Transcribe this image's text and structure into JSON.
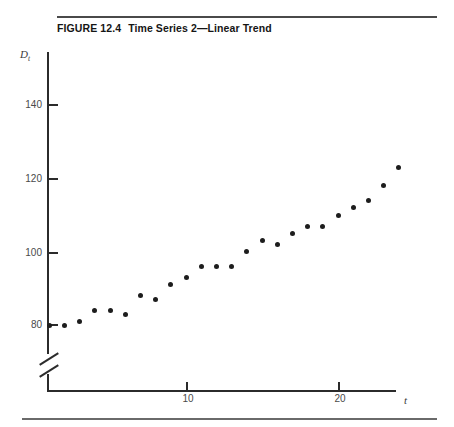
{
  "figure": {
    "number": "FIGURE 12.4",
    "title": "Time Series 2—Linear Trend"
  },
  "axes": {
    "y_title": "D",
    "y_subscript": "t",
    "x_title": "t",
    "y_ticks": [
      "80",
      "100",
      "120",
      "140"
    ],
    "x_ticks": [
      "10",
      "20"
    ],
    "y_axis_break": "double-slash-break"
  },
  "chart_data": {
    "type": "scatter",
    "title": "Time Series 2—Linear Trend",
    "xlabel": "t",
    "ylabel": "D_t",
    "xlim": [
      0,
      25
    ],
    "ylim": [
      76,
      148
    ],
    "xticks": [
      10,
      20
    ],
    "yticks": [
      80,
      100,
      120,
      140
    ],
    "grid": false,
    "legend": "none",
    "axis_break_y": true,
    "x": [
      1,
      2,
      3,
      4,
      5,
      6,
      7,
      8,
      9,
      10,
      11,
      12,
      13,
      14,
      15,
      16,
      17,
      18,
      19,
      20,
      21,
      22,
      23,
      24
    ],
    "y": [
      80,
      80,
      81,
      84,
      84,
      83,
      88,
      87,
      91,
      93,
      96,
      96,
      96,
      100,
      103,
      102,
      105,
      107,
      107,
      110,
      112,
      114,
      118,
      123
    ],
    "series": [
      {
        "name": "D_t",
        "marker": "filled-circle",
        "color": "#1d1d1d",
        "values": [
          80,
          80,
          81,
          84,
          84,
          83,
          88,
          87,
          91,
          93,
          96,
          96,
          96,
          100,
          103,
          102,
          105,
          107,
          107,
          110,
          112,
          114,
          118,
          123
        ]
      }
    ]
  },
  "colors": {
    "ink": "#1d1d1d",
    "axis": "#2b2b2b",
    "rule": "#4a4a4a",
    "background": "#ffffff"
  }
}
